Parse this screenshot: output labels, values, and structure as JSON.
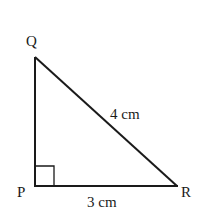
{
  "diagram": {
    "type": "right-triangle",
    "vertices": {
      "P": {
        "label": "P",
        "x": 35,
        "y": 186
      },
      "Q": {
        "label": "Q",
        "x": 35,
        "y": 57
      },
      "R": {
        "label": "R",
        "x": 177,
        "y": 186
      }
    },
    "sides": {
      "QR": {
        "label": "4 cm"
      },
      "PR": {
        "label": "3 cm"
      }
    },
    "right_angle_at": "P",
    "line_color": "#1a1a1a"
  }
}
